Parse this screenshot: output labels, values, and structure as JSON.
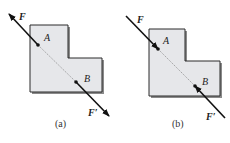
{
  "figures": [
    {
      "id": "a",
      "caption": "(a)",
      "point_a": "A",
      "point_b": "B",
      "force_top": "F",
      "force_bottom": "F′",
      "description": "Forces F and F′ applied at A and B along line AB, pointing away from each other (tension)"
    },
    {
      "id": "b",
      "caption": "(b)",
      "point_a": "A",
      "point_b": "B",
      "force_top": "F",
      "force_bottom": "F′",
      "description": "Forces F and F′ applied at A and B along line AB, pointing toward each other (compression)"
    }
  ],
  "colors": {
    "body_fill": "#e6e7ea",
    "body_stroke": "#2a2a2a",
    "shadow": "#8a8a8a",
    "line": "#111111"
  }
}
